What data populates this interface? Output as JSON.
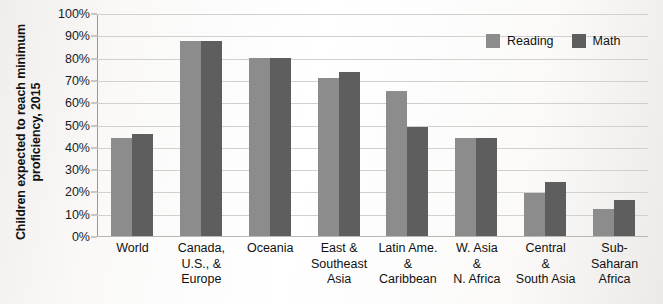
{
  "chart_data": {
    "type": "bar",
    "title": "",
    "subtitle": "",
    "xlabel": "",
    "ylabel": "Children expected to reach minimum proficiency, 2015",
    "ylim": [
      0,
      100
    ],
    "ytick_labels": [
      "100%",
      "90%",
      "80%",
      "70%",
      "60%",
      "50%",
      "40%",
      "30%",
      "20%",
      "10%",
      "0%"
    ],
    "ytick_values": [
      100,
      90,
      80,
      70,
      60,
      50,
      40,
      30,
      20,
      10,
      0
    ],
    "grid": true,
    "legend_position": "top-right",
    "categories": [
      "World",
      "Canada,\nU.S., &\nEurope",
      "Oceania",
      "East &\nSoutheast\nAsia",
      "Latin Ame.\n&\nCaribbean",
      "W. Asia\n&\nN. Africa",
      "Central\n&\nSouth Asia",
      "Sub-\nSaharan\nAfrica"
    ],
    "series": [
      {
        "name": "Reading",
        "color": "#8c8c8c",
        "values": [
          44,
          88,
          80,
          71,
          65.5,
          44,
          19.5,
          12
        ]
      },
      {
        "name": "Math",
        "color": "#5e5e5e",
        "values": [
          46,
          88,
          80,
          74,
          49,
          44,
          24.5,
          16
        ]
      }
    ]
  },
  "legend": {
    "items": [
      {
        "label": "Reading",
        "color": "#8c8c8c"
      },
      {
        "label": "Math",
        "color": "#5e5e5e"
      }
    ]
  }
}
